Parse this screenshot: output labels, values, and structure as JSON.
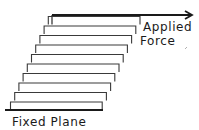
{
  "diagram": {
    "type": "shear-deformation",
    "labels": {
      "force_line1": "Applied",
      "force_line2": "Force",
      "base": "Fixed Plane"
    },
    "colors": {
      "stroke": "#1a1a1a",
      "layer_stroke": "#3a3a3a",
      "background": "#ffffff"
    },
    "layers": {
      "count": 10,
      "top_y": 15,
      "bottom_y": 110,
      "top_left_x": 52,
      "top_right_x": 140,
      "bottom_left_x": 10,
      "bottom_right_x": 98
    },
    "arrow": {
      "x1": 52,
      "y": 15,
      "x2": 192
    },
    "fixed_plane": {
      "x1": 5,
      "x2": 103,
      "y": 110
    }
  }
}
